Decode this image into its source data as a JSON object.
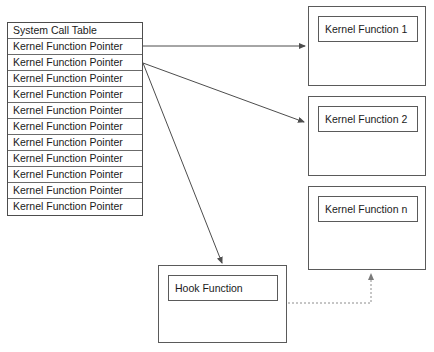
{
  "diagram": {
    "colors": {
      "stroke": "#5a5a5a",
      "table_stroke": "#4d4d4d",
      "text": "#1a1a1a",
      "background": "#ffffff",
      "dashed_stroke": "#8c8c8c"
    },
    "syscall_table": {
      "header": "System Call Table",
      "rows": [
        "Kernel Function Pointer",
        "Kernel Function Pointer",
        "Kernel Function Pointer",
        "Kernel Function Pointer",
        "Kernel Function Pointer",
        "Kernel Function Pointer",
        "Kernel Function Pointer",
        "Kernel Function Pointer",
        "Kernel Function Pointer",
        "Kernel Function Pointer",
        "Kernel Function Pointer"
      ]
    },
    "kernel_functions": [
      {
        "label": "Kernel Function 1"
      },
      {
        "label": "Kernel Function 2"
      },
      {
        "label": "Kernel Function n"
      }
    ],
    "hook": {
      "label": "Hook Function"
    },
    "connectors": [
      {
        "name": "pointer-to-kernel-function-1",
        "style": "solid",
        "from": "syscall-table-row-1",
        "to": "kernel-function-1"
      },
      {
        "name": "pointer-to-kernel-function-2",
        "style": "solid",
        "from": "syscall-table-row-2",
        "to": "kernel-function-2"
      },
      {
        "name": "pointer-to-hook-function",
        "style": "solid",
        "from": "syscall-table-row-2",
        "to": "hook-function"
      },
      {
        "name": "hook-function-to-kernel-function-n",
        "style": "dashed",
        "from": "hook-function",
        "to": "kernel-function-n"
      }
    ]
  }
}
